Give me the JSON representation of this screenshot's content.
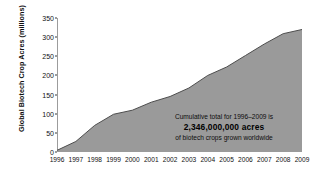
{
  "chart_data": {
    "type": "area",
    "title": "",
    "xlabel": "",
    "ylabel": "Global Biotech Crop Acres (millions)",
    "categories": [
      "1996",
      "1997",
      "1998",
      "1999",
      "2000",
      "2001",
      "2002",
      "2003",
      "2004",
      "2005",
      "2006",
      "2007",
      "2008",
      "2009"
    ],
    "values": [
      4.3,
      27.5,
      69.5,
      98.6,
      109.2,
      130.0,
      145.0,
      167.2,
      200.0,
      222.0,
      252.0,
      282.0,
      309.0,
      320.0
    ],
    "ylim": [
      0,
      350
    ],
    "yticks": [
      0,
      50,
      100,
      150,
      200,
      250,
      300,
      350
    ],
    "grid": false,
    "legend_position": "none",
    "series": [
      {
        "name": "Global Biotech Crop Acres (millions)",
        "values": [
          4.3,
          27.5,
          69.5,
          98.6,
          109.2,
          130.0,
          145.0,
          167.2,
          200.0,
          222.0,
          252.0,
          282.0,
          309.0,
          320.0
        ]
      }
    ],
    "area_fill_color": "#9a9a9a",
    "area_line_color": "#4d4d4d",
    "axis_color": "#3a3a3a",
    "annotations": [
      {
        "line1": "Cumulative total for 1996–2009 is",
        "line2": "2,346,000,000 acres",
        "line3": "of biotech crops grown worldwide"
      }
    ]
  }
}
